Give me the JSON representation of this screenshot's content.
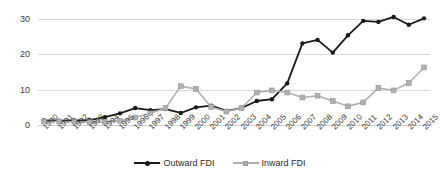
{
  "chart_data": {
    "type": "line",
    "title": "",
    "subtitle": "",
    "xlabel": "",
    "ylabel": "",
    "grid": true,
    "legend_position": "bottom-center",
    "ylim": [
      0,
      32
    ],
    "yticks": [
      0,
      10,
      20,
      30
    ],
    "ytick_labels": [
      "0",
      "10",
      "20",
      "30"
    ],
    "categories": [
      "1990",
      "1991",
      "1992",
      "1993",
      "1994",
      "1995",
      "1996",
      "1997",
      "1998",
      "1999",
      "2000",
      "2001",
      "2002",
      "2003",
      "2004",
      "2005",
      "2006",
      "2007",
      "2008",
      "2009",
      "2010",
      "2011",
      "2012",
      "2013",
      "2014",
      "2015"
    ],
    "series": [
      {
        "name": "Outward FDI",
        "color": "#1a1a1a",
        "marker": "circle",
        "values": [
          1.3,
          1.2,
          1.3,
          1.4,
          2.2,
          3.3,
          4.8,
          4.2,
          4.5,
          3.4,
          5.0,
          5.5,
          4.0,
          4.8,
          6.8,
          7.3,
          11.8,
          23.1,
          24.1,
          20.5,
          25.4,
          29.5,
          29.2,
          30.6,
          28.4,
          30.2
        ]
      },
      {
        "name": "Inward FDI",
        "color": "#b0b0b0",
        "marker": "square",
        "values": [
          1.0,
          1.0,
          0.9,
          0.8,
          0.9,
          1.2,
          2.1,
          3.3,
          4.8,
          11.0,
          10.2,
          5.1,
          3.8,
          4.8,
          9.2,
          9.8,
          9.2,
          7.8,
          8.3,
          6.8,
          5.3,
          6.4,
          10.5,
          9.8,
          11.9,
          16.3
        ]
      }
    ]
  }
}
